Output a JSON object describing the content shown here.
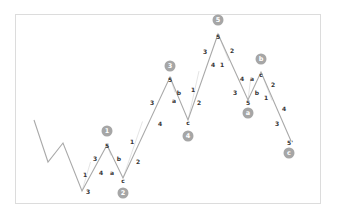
{
  "chart_data": {
    "type": "line",
    "title": "",
    "grid": false,
    "legend": null,
    "colors": {
      "line": "#a9a9a9",
      "marker": "#a6a6a6",
      "frame": "#dcdcdc",
      "label": "#333333"
    },
    "path": [
      {
        "x": 34,
        "y": 120
      },
      {
        "x": 48,
        "y": 162
      },
      {
        "x": 63,
        "y": 143
      },
      {
        "x": 82,
        "y": 191
      },
      {
        "x": 107,
        "y": 145
      },
      {
        "x": 123,
        "y": 178
      },
      {
        "x": 170,
        "y": 77
      },
      {
        "x": 188,
        "y": 120
      },
      {
        "x": 218,
        "y": 34
      },
      {
        "x": 248,
        "y": 100
      },
      {
        "x": 261,
        "y": 72
      },
      {
        "x": 291,
        "y": 141
      }
    ],
    "wave_markers": [
      {
        "label": "1",
        "x": 107,
        "y": 131
      },
      {
        "label": "2",
        "x": 123,
        "y": 193
      },
      {
        "label": "3",
        "x": 170,
        "y": 66
      },
      {
        "label": "4",
        "x": 188,
        "y": 136
      },
      {
        "label": "5",
        "x": 218,
        "y": 20
      },
      {
        "label": "a",
        "x": 248,
        "y": 113
      },
      {
        "label": "b",
        "x": 261,
        "y": 59
      },
      {
        "label": "c",
        "x": 289,
        "y": 153
      }
    ],
    "sub_labels": [
      {
        "text": "1",
        "x": 85,
        "y": 175
      },
      {
        "text": "3",
        "x": 88,
        "y": 192
      },
      {
        "text": "3",
        "x": 95,
        "y": 159
      },
      {
        "text": "4",
        "x": 101,
        "y": 173
      },
      {
        "text": "5",
        "x": 107,
        "y": 146
      },
      {
        "text": "a",
        "x": 112,
        "y": 173
      },
      {
        "text": "b",
        "x": 119,
        "y": 159
      },
      {
        "text": "c",
        "x": 123,
        "y": 181
      },
      {
        "text": "1",
        "x": 132,
        "y": 142
      },
      {
        "text": "2",
        "x": 138,
        "y": 162
      },
      {
        "text": "3",
        "x": 152,
        "y": 103
      },
      {
        "text": "4",
        "x": 160,
        "y": 124
      },
      {
        "text": "5",
        "x": 170,
        "y": 80
      },
      {
        "text": "a",
        "x": 174,
        "y": 101
      },
      {
        "text": "b",
        "x": 179,
        "y": 93
      },
      {
        "text": "c",
        "x": 188,
        "y": 123
      },
      {
        "text": "1",
        "x": 193,
        "y": 90
      },
      {
        "text": "2",
        "x": 199,
        "y": 103
      },
      {
        "text": "3",
        "x": 205,
        "y": 52
      },
      {
        "text": "4",
        "x": 213,
        "y": 65
      },
      {
        "text": "1",
        "x": 222,
        "y": 65
      },
      {
        "text": "5",
        "x": 218,
        "y": 37
      },
      {
        "text": "2",
        "x": 232,
        "y": 51
      },
      {
        "text": "4",
        "x": 242,
        "y": 79
      },
      {
        "text": "3",
        "x": 235,
        "y": 93
      },
      {
        "text": "5",
        "x": 248,
        "y": 103
      },
      {
        "text": "a",
        "x": 252,
        "y": 79
      },
      {
        "text": "b",
        "x": 257,
        "y": 93
      },
      {
        "text": "c",
        "x": 261,
        "y": 75
      },
      {
        "text": "2",
        "x": 273,
        "y": 85
      },
      {
        "text": "1",
        "x": 266,
        "y": 98
      },
      {
        "text": "4",
        "x": 284,
        "y": 109
      },
      {
        "text": "3",
        "x": 277,
        "y": 124
      },
      {
        "text": "5'",
        "x": 290,
        "y": 143
      }
    ]
  }
}
